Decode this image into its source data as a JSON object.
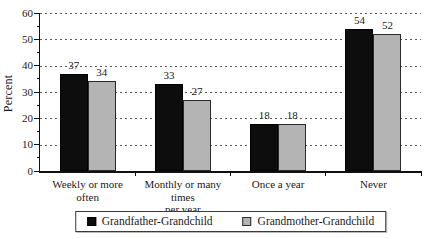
{
  "chart_data": {
    "type": "bar",
    "title": "",
    "xlabel": "",
    "ylabel": "Percent",
    "ylim": [
      0,
      60
    ],
    "yticks": [
      0,
      10,
      20,
      30,
      40,
      50,
      60
    ],
    "minor_tick_step": 5,
    "grid": "dashed-horizontal",
    "value_labels": true,
    "legend_position": "bottom-center",
    "categories": [
      {
        "lines": [
          "Weekly or more",
          "often"
        ]
      },
      {
        "lines": [
          "Monthly or many times",
          "per year"
        ]
      },
      {
        "lines": [
          "Once a year"
        ]
      },
      {
        "lines": [
          "Never"
        ]
      }
    ],
    "series": [
      {
        "name": "Grandfather-Grandchild",
        "color": "#0d0d0d",
        "border": "#000000",
        "values": [
          37,
          33,
          18,
          54
        ]
      },
      {
        "name": "Grandmother-Grandchild",
        "color": "#b4b4b4",
        "border": "#2b2b2b",
        "values": [
          34,
          27,
          18,
          52
        ]
      }
    ]
  },
  "colors": {
    "background": "#ffffff",
    "axis": "#111111",
    "gridline": "#5a5a5a",
    "text": "#1a1a1a",
    "legend_border": "#3a3a3a"
  }
}
